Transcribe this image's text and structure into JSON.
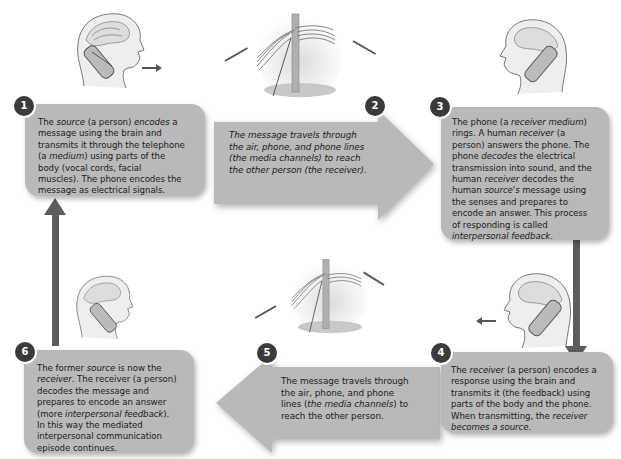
{
  "steps": [
    {
      "number": "1",
      "parts": [
        {
          "t": "The "
        },
        {
          "t": "source",
          "i": true
        },
        {
          "t": " (a person) "
        },
        {
          "t": "encodes",
          "i": true
        },
        {
          "t": " a message using the brain and transmits it through the telephone ("
        },
        {
          "t": "a "
        },
        {
          "t": "medium",
          "i": true
        },
        {
          "t": ") using parts of the body (vocal cords, facial muscles). The phone encodes the message as electrical signals."
        }
      ],
      "lines": [
        "The |source| (a person) |encodes| a",
        "message using the brain and",
        "transmits it through the telephone",
        "(a |medium|) using parts of the",
        "body (vocal cords, facial",
        "muscles). The phone encodes the",
        "message as electrical signals."
      ]
    },
    {
      "number": "2",
      "lines": [
        "|The message travels through|",
        "|the air, phone, and phone lines|",
        "|(the media channels) to reach|",
        "|the other person (the receiver).|"
      ]
    },
    {
      "number": "3",
      "lines": [
        "The phone (a |receiver medium|)",
        "rings. A human |receiver| (a",
        "person) answers the phone. The",
        "phone |decodes| the electrical",
        "transmission into sound, and the",
        "human |receiver| decodes the",
        "human |source's| message using",
        "the senses and prepares to",
        "encode an answer. This process",
        "of responding is called",
        "|interpersonal feedback|."
      ]
    },
    {
      "number": "4",
      "lines": [
        "The |receiver| (a person) encodes a",
        "response using the brain and",
        "transmits it (the feedback) using",
        "parts of the body and the phone.",
        "When transmitting, the |receiver|",
        "|becomes a source|."
      ]
    },
    {
      "number": "5",
      "lines": [
        "The message travels through",
        "the air, phone, and phone",
        "lines (|the media channels|) to",
        "reach the other person."
      ]
    },
    {
      "number": "6",
      "lines": [
        "The former |source| is now the",
        "|receiver|. The receiver (a person)",
        "decodes the message and",
        "prepares to encode an answer",
        "(more |interpersonal feedback|).",
        "In this way the mediated",
        "interpersonal communication",
        "episode continues."
      ]
    }
  ],
  "illustrations": {
    "top_left": "head-speaking-icon",
    "top_center": "telephone-pole-icon",
    "top_right": "head-listening-icon",
    "bottom_right": "head-speaking-icon",
    "bottom_center": "telephone-pole-icon",
    "bottom_left": "head-listening-icon"
  },
  "colors": {
    "box_fill": "#b9b9b9",
    "badge_fill": "#3a3a3a",
    "flow_arrow": "#5c5c5c",
    "text": "#1c1c1c"
  }
}
